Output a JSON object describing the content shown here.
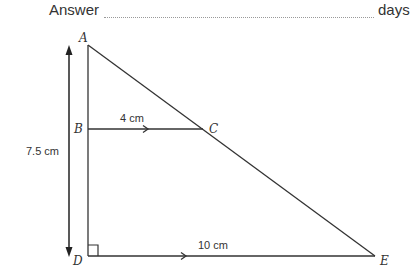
{
  "answer": {
    "label": "Answer",
    "value": "",
    "unit": "days"
  },
  "diagram": {
    "points": {
      "A": "A",
      "B": "B",
      "C": "C",
      "D": "D",
      "E": "E"
    },
    "measurements": {
      "AD": "7.5 cm",
      "BC": "4 cm",
      "DE": "10 cm"
    },
    "right_angle_at": "D",
    "parallel_lines": [
      "BC",
      "DE"
    ],
    "line_color": "#333333"
  }
}
